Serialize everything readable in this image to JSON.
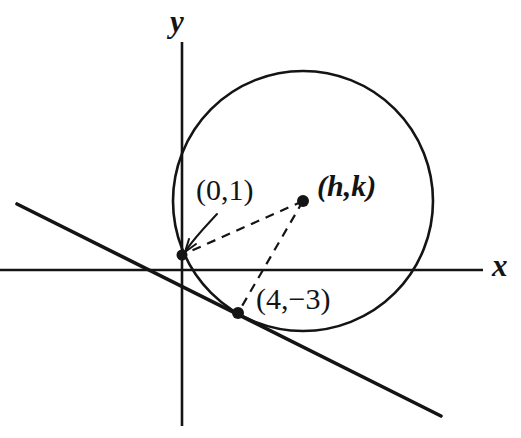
{
  "figure": {
    "background_color": "#ffffff",
    "ink_color": "#141414",
    "width": 521,
    "height": 438
  },
  "axes": {
    "x_label": "x",
    "y_label": "y",
    "x_axis": {
      "x1": 0,
      "y1": 270,
      "x2": 483,
      "y2": 270
    },
    "y_axis": {
      "x1": 182,
      "y1": 42,
      "x2": 182,
      "y2": 426
    },
    "x_label_pos": {
      "x": 492,
      "y": 276
    },
    "y_label_pos": {
      "x": 170,
      "y": 32
    }
  },
  "circle": {
    "center": {
      "x": 303,
      "y": 201
    },
    "radius": 130,
    "stroke_width": 2.6
  },
  "tangent_line": {
    "start": {
      "x": 17,
      "y": 204
    },
    "end": {
      "x": 441,
      "y": 416
    },
    "stroke_width": 3.6
  },
  "points": [
    {
      "id": "point-0-1",
      "label": "(0,1)",
      "dot": {
        "x": 182,
        "y": 255
      },
      "label_pos": {
        "x": 196,
        "y": 200
      },
      "dot_radius": 5.5
    },
    {
      "id": "point-h-k",
      "label": "(h,k)",
      "dot": {
        "x": 303,
        "y": 201
      },
      "label_pos": {
        "x": 317,
        "y": 196
      },
      "dot_radius": 6
    },
    {
      "id": "point-4-neg3",
      "label": "(4,−3)",
      "dot": {
        "x": 238,
        "y": 313
      },
      "label_pos": {
        "x": 256,
        "y": 309
      },
      "dot_radius": 6
    }
  ],
  "radii": [
    {
      "id": "radius-to-0-1",
      "from": {
        "x": 303,
        "y": 201
      },
      "to": {
        "x": 182,
        "y": 255
      },
      "dash": "9,7"
    },
    {
      "id": "radius-to-4-neg3",
      "from": {
        "x": 303,
        "y": 201
      },
      "to": {
        "x": 238,
        "y": 313
      },
      "dash": "9,7"
    }
  ],
  "annotation_arrow": {
    "id": "arrow-to-0-1",
    "path": "M 217 214 C 206 226 196 236 187 249",
    "head": "M 187 249 L 196 244 M 187 249 L 190 238",
    "stroke_width": 2
  }
}
